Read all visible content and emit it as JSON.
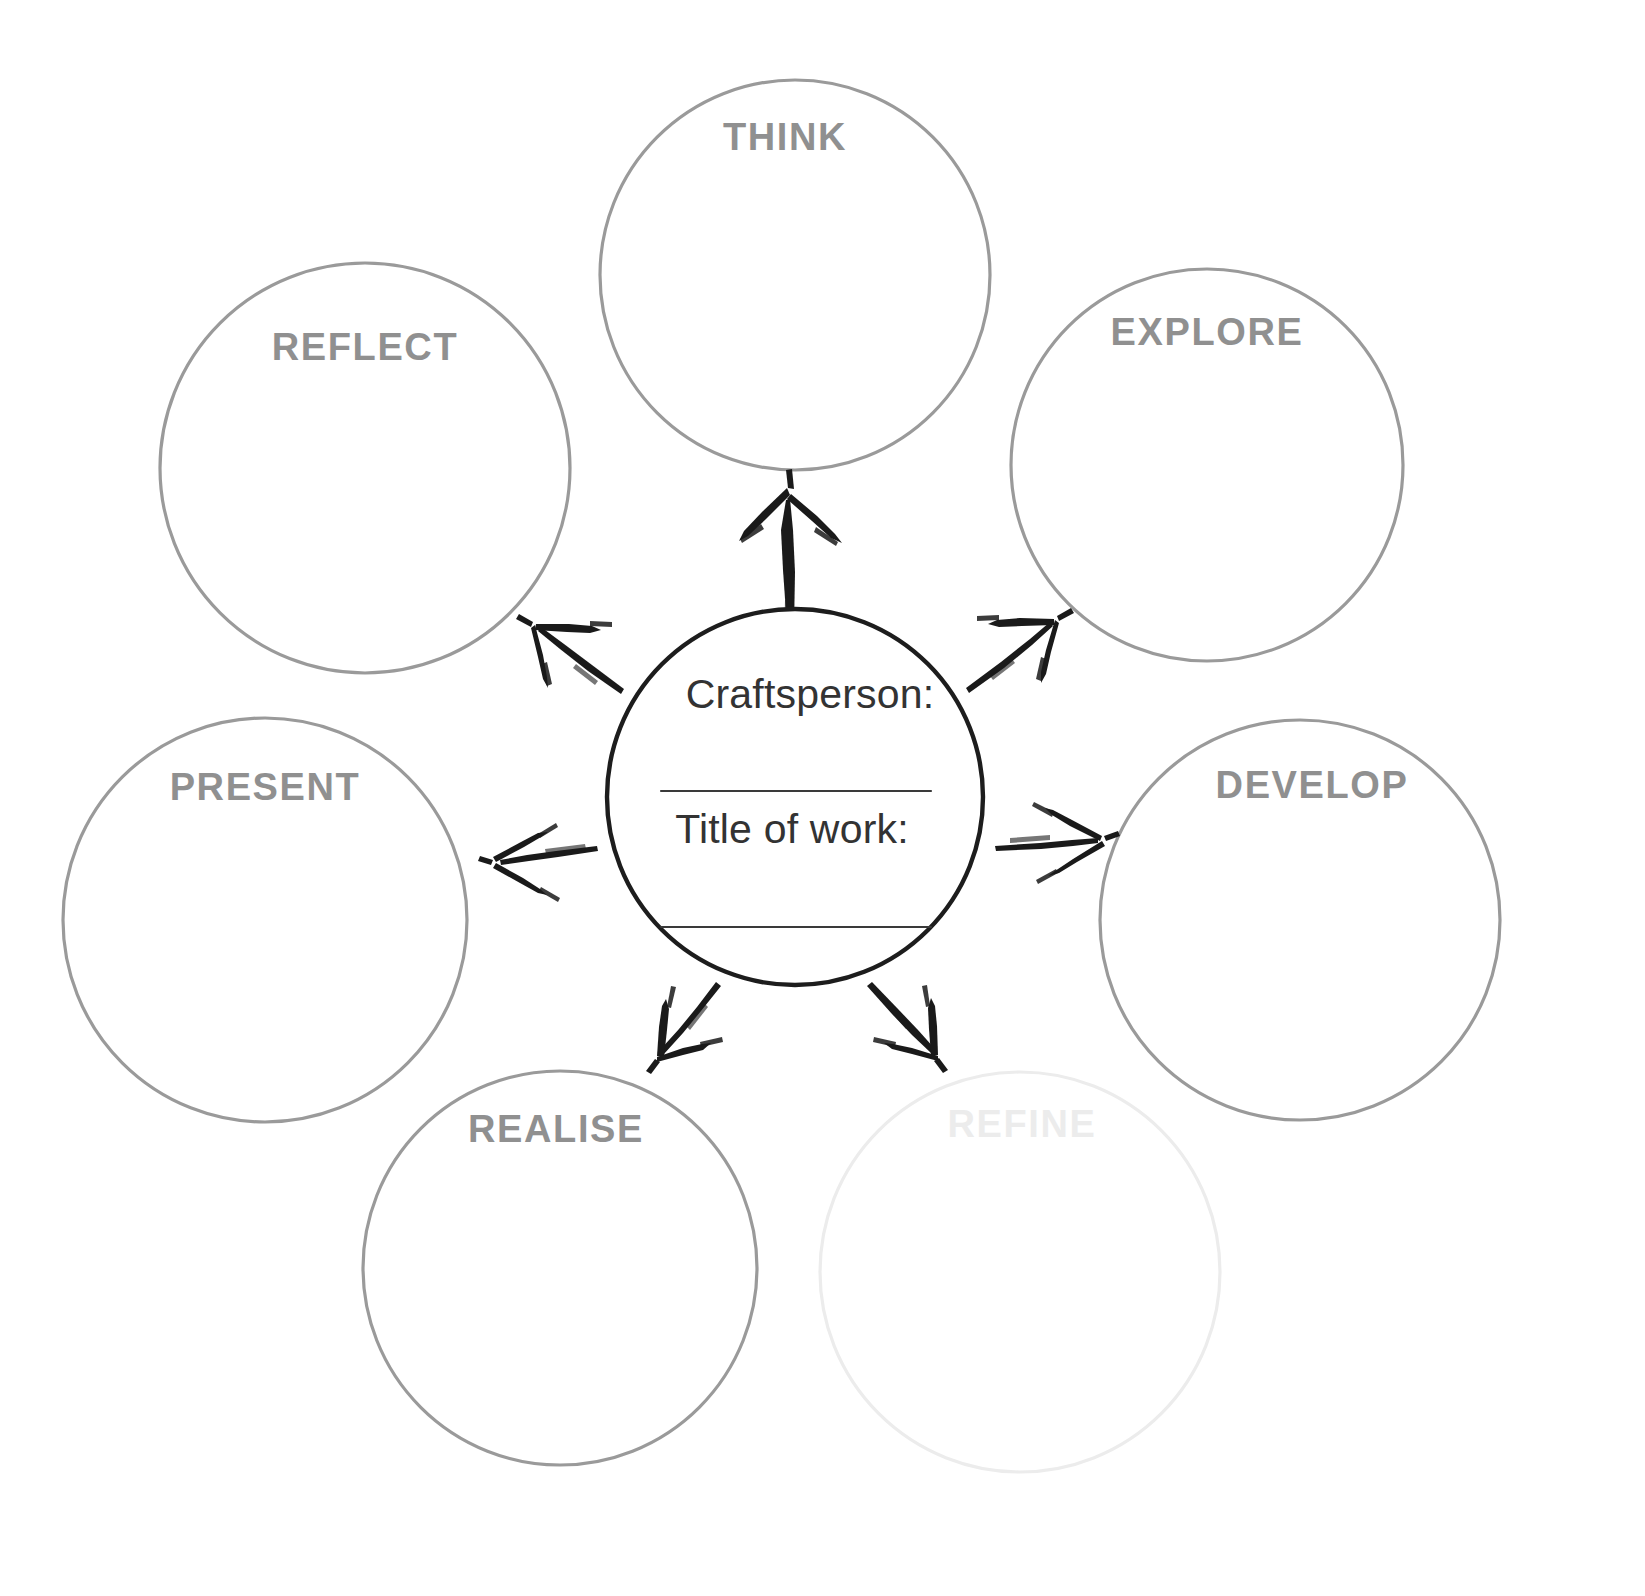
{
  "diagram": {
    "type": "radial-hub-and-spoke",
    "title_hidden": true,
    "background_color": "#ffffff",
    "center": {
      "name": "center-hub",
      "fields": [
        {
          "label": "Craftsperson:",
          "value": "",
          "has_write_line": true
        },
        {
          "label": "Title of work:",
          "value": "",
          "has_write_line": true
        }
      ],
      "stroke_color": "#1d1d1d",
      "cx": 795,
      "cy": 797,
      "r": 188
    },
    "nodes": [
      {
        "id": "think",
        "label": "THINK",
        "cx": 795,
        "cy": 275,
        "r": 195,
        "label_x": 785,
        "label_y": 150,
        "stroke_color": "#9a9a9a",
        "text_color": "#909090",
        "faded": false
      },
      {
        "id": "explore",
        "label": "EXPLORE",
        "cx": 1207,
        "cy": 465,
        "r": 196,
        "label_x": 1207,
        "label_y": 345,
        "stroke_color": "#9a9a9a",
        "text_color": "#909090",
        "faded": false
      },
      {
        "id": "develop",
        "label": "DEVELOP",
        "cx": 1300,
        "cy": 920,
        "r": 200,
        "label_x": 1312,
        "label_y": 798,
        "stroke_color": "#9a9a9a",
        "text_color": "#909090",
        "faded": false
      },
      {
        "id": "refine",
        "label": "REFINE",
        "cx": 1020,
        "cy": 1272,
        "r": 200,
        "label_x": 1022,
        "label_y": 1137,
        "stroke_color": "#ececec",
        "text_color": "#ececec",
        "faded": true
      },
      {
        "id": "realise",
        "label": "REALISE",
        "cx": 560,
        "cy": 1268,
        "r": 197,
        "label_x": 556,
        "label_y": 1142,
        "stroke_color": "#9a9a9a",
        "text_color": "#909090",
        "faded": false
      },
      {
        "id": "present",
        "label": "PRESENT",
        "cx": 265,
        "cy": 920,
        "r": 202,
        "label_x": 265,
        "label_y": 800,
        "stroke_color": "#9a9a9a",
        "text_color": "#909090",
        "faded": false
      },
      {
        "id": "reflect",
        "label": "REFLECT",
        "cx": 365,
        "cy": 468,
        "r": 205,
        "label_x": 365,
        "label_y": 360,
        "stroke_color": "#9a9a9a",
        "text_color": "#909090",
        "faded": false
      }
    ],
    "arrows": [
      {
        "id": "arrow-to-think",
        "from": "center-hub",
        "to": "think",
        "direction": "up",
        "ink_color": "#1a1a1a"
      },
      {
        "id": "arrow-to-explore",
        "from": "center-hub",
        "to": "explore",
        "direction": "up-right",
        "ink_color": "#1a1a1a"
      },
      {
        "id": "arrow-to-develop",
        "from": "center-hub",
        "to": "develop",
        "direction": "right",
        "ink_color": "#1a1a1a"
      },
      {
        "id": "arrow-to-refine",
        "from": "center-hub",
        "to": "refine",
        "direction": "down-right",
        "ink_color": "#1a1a1a"
      },
      {
        "id": "arrow-to-realise",
        "from": "center-hub",
        "to": "realise",
        "direction": "down-left",
        "ink_color": "#1a1a1a"
      },
      {
        "id": "arrow-to-present",
        "from": "center-hub",
        "to": "present",
        "direction": "left",
        "ink_color": "#1a1a1a"
      },
      {
        "id": "arrow-to-reflect",
        "from": "center-hub",
        "to": "reflect",
        "direction": "up-left",
        "ink_color": "#1a1a1a"
      }
    ]
  }
}
